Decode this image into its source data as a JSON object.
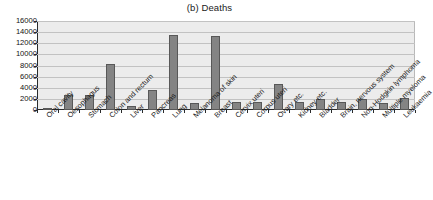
{
  "chart_data": {
    "type": "bar",
    "title": "(b) Deaths",
    "xlabel": "",
    "ylabel": "",
    "ylim": [
      0,
      16000
    ],
    "ytick_step": 2000,
    "grid": true,
    "legend": "none",
    "bar_color": "#848484",
    "bar_border_color": "#585858",
    "plot_background": "#ececec",
    "gridline_color": "#c2c2c2",
    "axis_color": "#2b2b2b",
    "ytick_labels": [
      "16000",
      "14000",
      "12000",
      "10000",
      "8000",
      "6000",
      "4000",
      "2000",
      "0"
    ],
    "ytick_values": [
      16000,
      14000,
      12000,
      10000,
      8000,
      6000,
      4000,
      2000,
      0
    ],
    "categories": [
      "Oral cavity",
      "Oesophagus",
      "Stomach",
      "Colon and rectum",
      "Liver",
      "Pancreas",
      "Lung",
      "Melanoma of skin",
      "Breast",
      "Cervix uteri",
      "Corpus uteri",
      "Ovary etc.",
      "Kidney etc.",
      "Bladder",
      "Brain, nervous system",
      "Non-Hodgkin lymphoma",
      "Multiple myeloma",
      "Leukaemia"
    ],
    "values": [
      400,
      2750,
      2700,
      8300,
      800,
      3650,
      13450,
      1200,
      13350,
      1500,
      1500,
      4700,
      1450,
      1950,
      1400,
      2000,
      1350,
      2100
    ]
  }
}
